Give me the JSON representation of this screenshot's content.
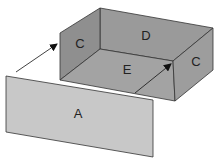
{
  "diagram": {
    "type": "exploded box / panel insertion",
    "labels": {
      "front_panel": "A",
      "left_side": "C",
      "back_wall": "D",
      "floor": "E",
      "right_side": "C"
    },
    "colors": {
      "box_dark": "#8e8e8e",
      "box_mid": "#9c9c9c",
      "floor": "#a4a4a4",
      "panel": "#c9c9c9",
      "edge": "#333333",
      "background": "#ffffff"
    },
    "arrows": [
      {
        "from": "front-left of panel A",
        "to": "left side C"
      },
      {
        "from": "floor E",
        "to": "right side C"
      }
    ]
  }
}
